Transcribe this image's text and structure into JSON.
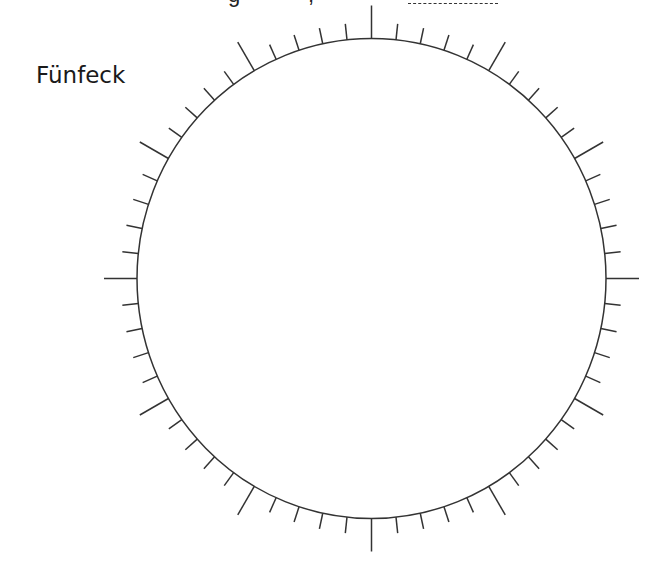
{
  "header": {
    "cut_text_left": "g",
    "cut_text_right": ",",
    "answer_blank": {
      "x": 408,
      "width": 90
    }
  },
  "figure": {
    "label": "Fünfeck",
    "circle": {
      "cx": 371.5,
      "cy": 278.5,
      "rx": 234.5,
      "ry": 240
    },
    "ticks": {
      "count": 60,
      "major_every": 5,
      "major_length": 33,
      "minor_length": 16
    },
    "stroke_color": "#333333",
    "stroke_width": 1.5
  }
}
